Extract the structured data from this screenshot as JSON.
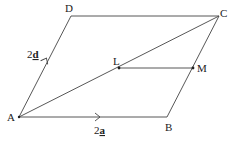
{
  "diagram": {
    "type": "parallelogram-vector-diagram",
    "points": {
      "A": {
        "label": "A",
        "x": 19,
        "y": 117
      },
      "B": {
        "label": "B",
        "x": 167,
        "y": 117
      },
      "C": {
        "label": "C",
        "x": 219,
        "y": 16
      },
      "D": {
        "label": "D",
        "x": 71,
        "y": 16
      },
      "L": {
        "label": "L",
        "x": 119,
        "y": 68
      },
      "M": {
        "label": "M",
        "x": 193,
        "y": 68
      }
    },
    "edges": [
      {
        "from": "A",
        "to": "B"
      },
      {
        "from": "B",
        "to": "C"
      },
      {
        "from": "C",
        "to": "D"
      },
      {
        "from": "D",
        "to": "A"
      },
      {
        "from": "A",
        "to": "C"
      },
      {
        "from": "L",
        "to": "M"
      }
    ],
    "vectors": {
      "AB": {
        "coef": "2",
        "symbol": "a",
        "label": "2a"
      },
      "AD": {
        "coef": "2",
        "symbol": "d",
        "label": "2d"
      }
    },
    "colors": {
      "line": "#444444",
      "text": "#222222",
      "background": "#ffffff"
    }
  }
}
